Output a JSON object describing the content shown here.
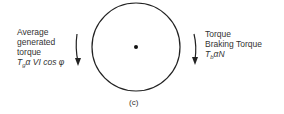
{
  "figure": {
    "caption": "(c)",
    "left_label": {
      "lines": [
        "Average",
        "generated",
        "torque"
      ],
      "equation": {
        "symbol": "T",
        "subscript": "g",
        "relation": "α",
        "rhs": "VI cos φ"
      },
      "arrow_direction": "down"
    },
    "right_label": {
      "lines": [
        "Torque",
        "Braking Torque"
      ],
      "equation": {
        "symbol": "T",
        "subscript": "b",
        "relation": "α",
        "rhs": "N"
      },
      "arrow_direction": "down"
    },
    "rotor": {
      "shape": "circle",
      "center_dot": true
    }
  }
}
